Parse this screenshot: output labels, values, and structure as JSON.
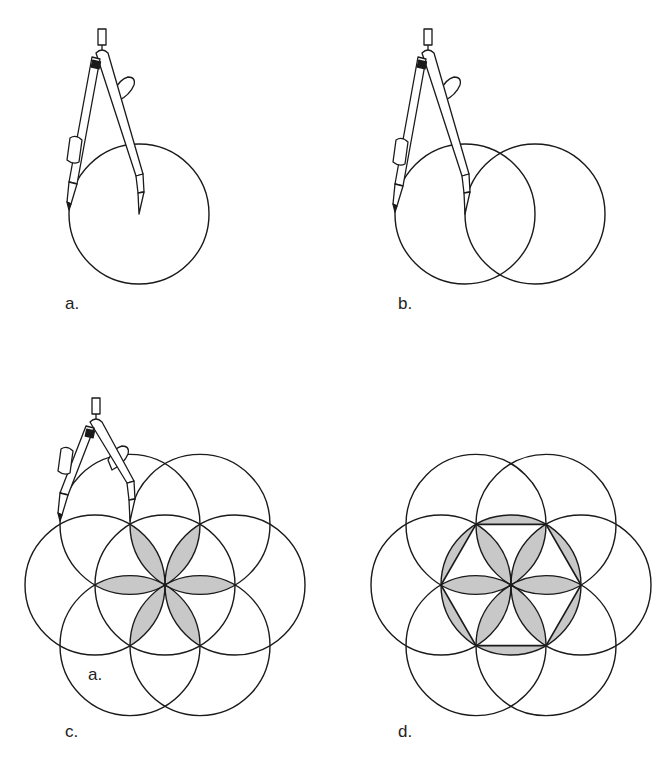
{
  "figure": {
    "colors": {
      "stroke": "#1a1a1a",
      "shade": "#c8c8c8",
      "background": "#ffffff"
    },
    "radius": 70,
    "panels": [
      {
        "id": "a",
        "label": "a.",
        "center": [
          139,
          214
        ],
        "circles": 1,
        "compass": true,
        "petals": false,
        "hexagon": false
      },
      {
        "id": "b",
        "label": "b.",
        "center": [
          465,
          214
        ],
        "circles": 2,
        "compass": true,
        "petals": false,
        "hexagon": false
      },
      {
        "id": "c",
        "label": "c.",
        "center": [
          165,
          585
        ],
        "circles": 7,
        "compass": true,
        "petals": true,
        "hexagon": false,
        "inner_label": "a."
      },
      {
        "id": "d",
        "label": "d.",
        "center": [
          511,
          585
        ],
        "circles": 7,
        "compass": false,
        "petals": true,
        "hexagon": true
      }
    ]
  }
}
